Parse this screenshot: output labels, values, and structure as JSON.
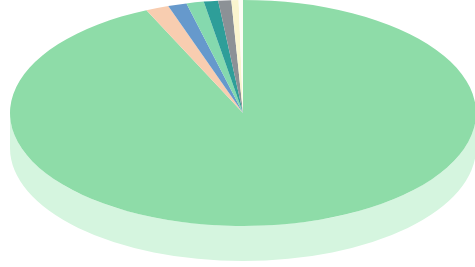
{
  "chart_data": {
    "type": "pie",
    "title": "",
    "subtitle": "",
    "xlabel": "",
    "ylabel": "",
    "grid": false,
    "legend_position": "none",
    "three_d": true,
    "start_angle_deg": 0,
    "direction": "clockwise",
    "labels": [
      "Slice 1",
      "Slice 2",
      "Slice 3",
      "Slice 4",
      "Slice 5",
      "Slice 6",
      "Slice 7",
      "Slice 8"
    ],
    "values": [
      93.2,
      1.6,
      1.3,
      1.2,
      1.0,
      0.9,
      0.5,
      0.3
    ],
    "percentages": [
      "93.2%",
      "1.6%",
      "1.3%",
      "1.2%",
      "1.0%",
      "0.9%",
      "0.5%",
      "0.3%"
    ],
    "colors": [
      "#8edca8",
      "#f8cdb0",
      "#6699cc",
      "#85d9ae",
      "#2e9e99",
      "#8c9196",
      "#faf5cf",
      "#fdfdf5"
    ],
    "side_colors": [
      "#d5f5df",
      "#f6ded0",
      "#aac6e2",
      "#cdeedb",
      "#9ccfcd",
      "#c6c9cc",
      "#fcfae8",
      "#fefefa"
    ]
  },
  "geometry": {
    "center_x": 243,
    "center_y": 113,
    "radius_x": 233,
    "radius_y": 113,
    "depth": 35
  },
  "canvas": {
    "width": 475,
    "height": 267,
    "background": "#ffffff"
  },
  "chart": {
    "name": "3d-pie-chart",
    "alt": "Three dimensional pie chart with one dominant light green slice and seven thin slices"
  }
}
